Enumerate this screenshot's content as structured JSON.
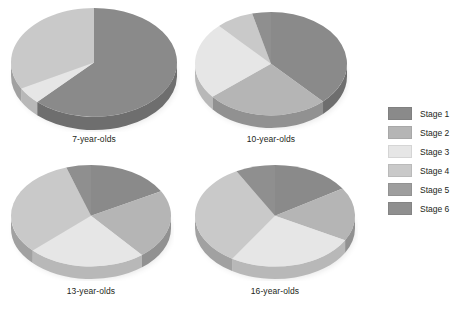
{
  "figure": {
    "background": "#ffffff",
    "text_color": "#231f20"
  },
  "legend": {
    "position": "right",
    "entries": [
      {
        "label": "Stage 1",
        "color": "#8a8a8a"
      },
      {
        "label": "Stage 2",
        "color": "#b5b5b5"
      },
      {
        "label": "Stage 3",
        "color": "#e6e6e6"
      },
      {
        "label": "Stage 4",
        "color": "#c9c9c9"
      },
      {
        "label": "Stage 5",
        "color": "#9e9e9e"
      },
      {
        "label": "Stage 6",
        "color": "#8f8f8f"
      }
    ]
  },
  "chart_data": [
    {
      "type": "pie",
      "title": "7-year-olds",
      "categories": [
        "Stage 1",
        "Stage 2",
        "Stage 3",
        "Stage 4",
        "Stage 5",
        "Stage 6"
      ],
      "values": [
        62,
        0,
        5,
        33,
        0,
        0
      ],
      "colors": [
        "#8a8a8a",
        "#b5b5b5",
        "#e6e6e6",
        "#c9c9c9",
        "#9e9e9e",
        "#8f8f8f"
      ],
      "start_angle": 0,
      "depth_3d": true
    },
    {
      "type": "pie",
      "title": "10-year-olds",
      "categories": [
        "Stage 1",
        "Stage 2",
        "Stage 3",
        "Stage 4",
        "Stage 5",
        "Stage 6"
      ],
      "values": [
        38,
        26,
        24,
        8,
        0,
        4
      ],
      "colors": [
        "#8a8a8a",
        "#b5b5b5",
        "#e6e6e6",
        "#c9c9c9",
        "#9e9e9e",
        "#8f8f8f"
      ],
      "start_angle": 0,
      "depth_3d": true
    },
    {
      "type": "pie",
      "title": "13-year-olds",
      "categories": [
        "Stage 1",
        "Stage 2",
        "Stage 3",
        "Stage 4",
        "Stage 5",
        "Stage 6"
      ],
      "values": [
        17,
        22,
        24,
        32,
        0,
        5
      ],
      "colors": [
        "#8a8a8a",
        "#b5b5b5",
        "#e6e6e6",
        "#c9c9c9",
        "#9e9e9e",
        "#8f8f8f"
      ],
      "start_angle": 0,
      "depth_3d": true
    },
    {
      "type": "pie",
      "title": "16-year-olds",
      "categories": [
        "Stage 1",
        "Stage 2",
        "Stage 3",
        "Stage 4",
        "Stage 5",
        "Stage 6"
      ],
      "values": [
        16,
        17,
        26,
        33,
        0,
        8
      ],
      "colors": [
        "#8a8a8a",
        "#b5b5b5",
        "#e6e6e6",
        "#c9c9c9",
        "#9e9e9e",
        "#8f8f8f"
      ],
      "start_angle": 0,
      "depth_3d": true
    }
  ]
}
